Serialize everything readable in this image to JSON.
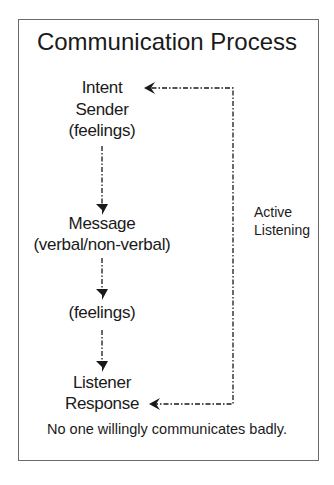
{
  "diagram": {
    "title": "Communication Process",
    "nodes": [
      {
        "id": "intent",
        "label": "Intent"
      },
      {
        "id": "sender",
        "label": "Sender"
      },
      {
        "id": "sender_feelings",
        "label": "(feelings)"
      },
      {
        "id": "message",
        "label": "Message"
      },
      {
        "id": "message_type",
        "label": "(verbal/non-verbal)"
      },
      {
        "id": "feelings",
        "label": "(feelings)"
      },
      {
        "id": "listener",
        "label": "Listener"
      },
      {
        "id": "response",
        "label": "Response"
      }
    ],
    "feedback_label": [
      "Active",
      "Listening"
    ],
    "footer": "No one willingly communicates badly.",
    "edges": [
      {
        "from": "sender_feelings",
        "to": "message",
        "style": "dash-dot"
      },
      {
        "from": "message_type",
        "to": "feelings",
        "style": "dash-dot"
      },
      {
        "from": "feelings",
        "to": "listener",
        "style": "dash-dot"
      },
      {
        "from": "response",
        "to": "intent",
        "style": "dash-dot",
        "label": "Active Listening"
      }
    ],
    "colors": {
      "line": "#1a1a1a",
      "border": "#6a6a6a",
      "background": "#ffffff"
    }
  }
}
